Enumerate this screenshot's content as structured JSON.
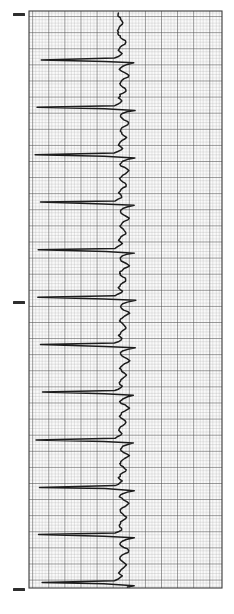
{
  "document": {
    "title": "ECG Rhythm Strip",
    "kind": "electrocardiogram-paper-trace",
    "orientation": "rotated-90-vertical",
    "background_color": "#ffffff",
    "canvas": {
      "width": 234,
      "height": 614
    }
  },
  "grid": {
    "label": "ecg-graph-paper",
    "x0": 29,
    "y0": 11,
    "x1": 222,
    "y1": 588,
    "minor_spacing_px": 3.22,
    "major_every_n_minor": 5,
    "minor_color": "#9a9a9a",
    "major_color": "#4a4a4a",
    "border_color": "#3a3a3a",
    "paper_color": "#fbfbfb"
  },
  "margin_ticks": {
    "label": "calibration-tick-marks",
    "color": "#2e2e2e",
    "x": 13,
    "width": 12,
    "height": 3,
    "y_positions": [
      14,
      302,
      589
    ]
  },
  "trace": {
    "label": "ecg-waveform",
    "color": "#1c1c1c",
    "stroke_width": 1.5,
    "baseline_x": 120,
    "beats": 12,
    "beat_period_px": 47.5,
    "first_beat_y": 36
  },
  "chart_data": {
    "type": "line",
    "subtitle": "",
    "xlabel": "Amplitude (mV)",
    "ylabel": "Time (s)",
    "orientation": "vertical-time-axis",
    "grid": true,
    "legend": "none",
    "xlim": [
      -1.8,
      1.2
    ],
    "ylim": [
      0,
      12
    ],
    "paper_speed_mm_per_s": 25,
    "calibration_mm_per_mV": 10,
    "beat_count": 12,
    "rr_interval_s": 0.76,
    "estimated_rate_bpm": 79,
    "series": [
      {
        "name": "Lead II",
        "description": "Repeating P-QRS-T complexes; tall negative-going R deflection drawn toward the left margin on this rotated strip.",
        "beat_template_mV": [
          0.0,
          0.02,
          0.05,
          0.09,
          0.12,
          0.1,
          0.05,
          0.01,
          0.0,
          -0.02,
          0.0,
          0.04,
          0.02,
          -0.04,
          -0.1,
          -1.55,
          -0.3,
          0.28,
          0.14,
          0.05,
          0.02,
          0.0,
          0.03,
          0.08,
          0.14,
          0.18,
          0.15,
          0.09,
          0.04,
          0.01,
          0.0
        ],
        "beat_onsets_s": [
          0.3,
          1.06,
          1.82,
          2.58,
          3.34,
          4.1,
          4.86,
          5.62,
          6.38,
          7.14,
          7.9,
          8.66
        ]
      }
    ],
    "annotations": [
      {
        "name": "calibration-tick-top",
        "y_s": 0.05
      },
      {
        "name": "calibration-tick-middle",
        "y_s": 6.05
      },
      {
        "name": "calibration-tick-bottom",
        "y_s": 11.98
      }
    ]
  }
}
